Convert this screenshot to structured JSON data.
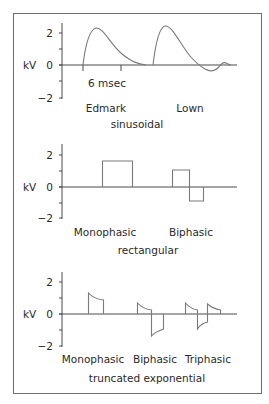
{
  "figure": {
    "panels": [
      {
        "id": "sinusoidal",
        "ylabel": "kV",
        "yticks": [
          "2",
          "0",
          "−2"
        ],
        "time_marker": "6 msec",
        "waveforms": [
          "Edmark",
          "Lown"
        ],
        "caption": "sinusoidal"
      },
      {
        "id": "rectangular",
        "ylabel": "kV",
        "yticks": [
          "2",
          "0",
          "−2"
        ],
        "waveforms": [
          "Monophasic",
          "Biphasic"
        ],
        "caption": "rectangular"
      },
      {
        "id": "truncated-exponential",
        "ylabel": "kV",
        "yticks": [
          "2",
          "0",
          "−2"
        ],
        "waveforms": [
          "Monophasic",
          "Biphasic",
          "Triphasic"
        ],
        "caption": "truncated exponential"
      }
    ],
    "colors": {
      "frame": "#6e6e6e",
      "axis": "#4a4a4a",
      "wave": "#7a7a7a",
      "text": "#2a2a2a"
    }
  }
}
